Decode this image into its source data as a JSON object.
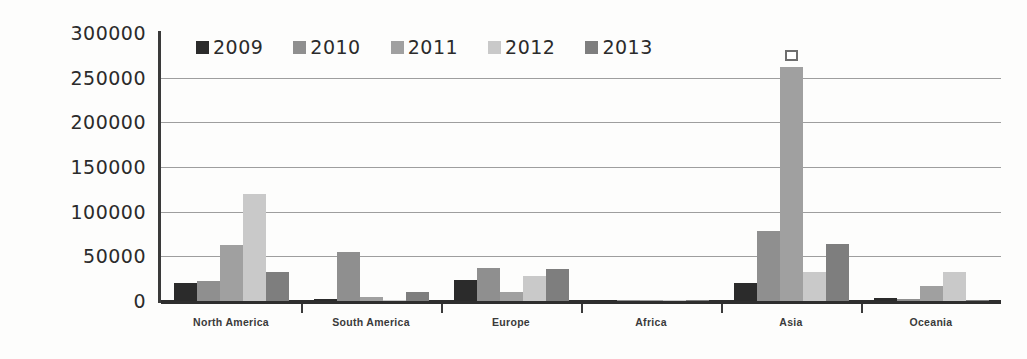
{
  "chart_data": {
    "type": "bar",
    "title": "",
    "xlabel": "",
    "ylabel": "",
    "ylim": [
      0,
      300000
    ],
    "ytick_values": [
      300000,
      250000,
      200000,
      150000,
      100000,
      50000,
      0
    ],
    "ytick_labels": [
      "300000",
      "250000",
      "200000",
      "150000",
      "100000",
      "50000",
      "0"
    ],
    "grid": true,
    "legend_position": "top-left-inside",
    "categories": [
      "North America",
      "South America",
      "Europe",
      "Africa",
      "Asia",
      "Oceania"
    ],
    "series": [
      {
        "name": "2009",
        "color": "#2b2b2b",
        "values": [
          20000,
          2000,
          23000,
          600,
          20000,
          3000
        ]
      },
      {
        "name": "2010",
        "color": "#8f8f8f",
        "values": [
          22000,
          55000,
          37000,
          800,
          78000,
          2000
        ]
      },
      {
        "name": "2011",
        "color": "#a0a0a0",
        "values": [
          63000,
          4000,
          10000,
          500,
          262000,
          17000
        ]
      },
      {
        "name": "2012",
        "color": "#c9c9c9",
        "values": [
          120000,
          500,
          28000,
          400,
          33000,
          32000
        ]
      },
      {
        "name": "2013",
        "color": "#7e7e7e",
        "values": [
          32000,
          10000,
          36000,
          600,
          64000,
          500
        ]
      }
    ],
    "annotations": [
      {
        "name": "selected-point-marker",
        "shape": "hollow-square",
        "category": "Asia",
        "series": "2011",
        "value": 262000
      }
    ]
  },
  "legend": {
    "items": [
      {
        "label": "2009"
      },
      {
        "label": "2010"
      },
      {
        "label": "2011"
      },
      {
        "label": "2012"
      },
      {
        "label": "2013"
      }
    ]
  },
  "colors": {
    "axis": "#2e2e2e",
    "grid": "#8d8d8d",
    "background": "#fdfdfc",
    "text": "#2b2b2b"
  }
}
